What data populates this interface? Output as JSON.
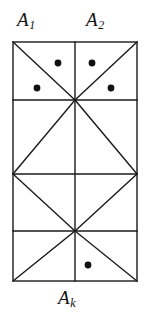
{
  "figure": {
    "title_labels": {
      "top_left": {
        "base": "A",
        "sub": "1"
      },
      "top_right": {
        "base": "A",
        "sub": "2"
      },
      "bottom": {
        "base": "A",
        "sub": "k"
      }
    },
    "colors": {
      "stroke": "#1a1a1a",
      "dot": "#111111",
      "background": "#ffffff",
      "text": "#121212"
    },
    "geometry": {
      "rect": {
        "x1": 13,
        "y1": 42,
        "x2": 137,
        "y2": 281
      },
      "vertical_center_x": 75,
      "horizontal_lines_y": [
        100,
        174,
        231
      ],
      "stroke_width": 1.4,
      "diagonals": [
        {
          "x1": 13,
          "y1": 42,
          "x2": 75,
          "y2": 100
        },
        {
          "x1": 137,
          "y1": 42,
          "x2": 75,
          "y2": 100
        },
        {
          "x1": 75,
          "y1": 100,
          "x2": 13,
          "y2": 174
        },
        {
          "x1": 75,
          "y1": 100,
          "x2": 137,
          "y2": 174
        },
        {
          "x1": 13,
          "y1": 174,
          "x2": 75,
          "y2": 231
        },
        {
          "x1": 137,
          "y1": 174,
          "x2": 75,
          "y2": 231
        },
        {
          "x1": 75,
          "y1": 231,
          "x2": 13,
          "y2": 281
        },
        {
          "x1": 75,
          "y1": 231,
          "x2": 137,
          "y2": 281
        }
      ],
      "dots": [
        {
          "cx": 58,
          "cy": 63,
          "r": 3.4
        },
        {
          "cx": 92,
          "cy": 63,
          "r": 3.4
        },
        {
          "cx": 37,
          "cy": 88,
          "r": 3.4
        },
        {
          "cx": 111,
          "cy": 88,
          "r": 3.4
        },
        {
          "cx": 88,
          "cy": 265,
          "r": 3.4
        }
      ]
    }
  }
}
